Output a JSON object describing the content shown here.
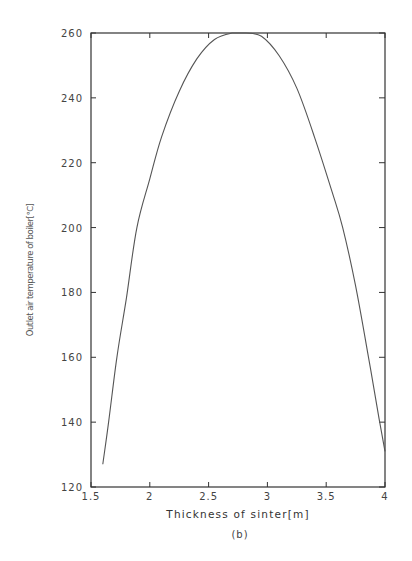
{
  "chart_data": {
    "type": "line",
    "title": "",
    "xlabel": "Thickness of sinter[m]",
    "ylabel": "Outlet air temperature of boiler[℃]",
    "caption": "(b)",
    "xlim": [
      1.5,
      4
    ],
    "ylim": [
      120,
      260
    ],
    "xticks": [
      1.5,
      2,
      2.5,
      3,
      3.5,
      4
    ],
    "xtick_labels": [
      "1.5",
      "2",
      "2.5",
      "3",
      "3.5",
      "4"
    ],
    "yticks": [
      120,
      140,
      160,
      180,
      200,
      220,
      240,
      260
    ],
    "ytick_labels": [
      "120",
      "140",
      "160",
      "180",
      "200",
      "220",
      "240",
      "260"
    ],
    "grid": false,
    "legend": null,
    "series": [
      {
        "name": "Outlet air temperature",
        "x": [
          1.6,
          1.65,
          1.72,
          1.8,
          1.89,
          2.0,
          2.1,
          2.25,
          2.4,
          2.55,
          2.7,
          2.82,
          2.95,
          3.1,
          3.25,
          3.4,
          3.55,
          3.64,
          3.75,
          3.86,
          3.95,
          4.0
        ],
        "y": [
          127,
          140,
          160,
          178,
          200,
          215,
          228,
          242,
          252,
          258,
          260,
          260,
          259,
          253,
          243,
          228,
          211,
          200,
          182,
          160,
          141,
          131
        ]
      }
    ]
  },
  "colors": {
    "axis": "#333333",
    "line": "#555555",
    "text": "#444444",
    "background": "#ffffff"
  }
}
